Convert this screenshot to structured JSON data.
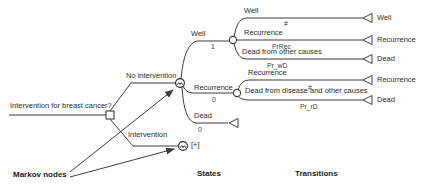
{
  "colors": {
    "line": "#3d3d3d",
    "text": "#2b2b2b",
    "background": "#ffffff"
  },
  "icons": {
    "decision_node": "decision-node-square-icon",
    "markov_node": "markov-node-circle-m-icon",
    "chance_node": "chance-node-circle-icon",
    "terminal_node": "terminal-node-triangle-icon",
    "annotation_arrow": "arrow-icon"
  },
  "tree": {
    "root_question": "Intervention for breast cancer?",
    "decision_branches": [
      {
        "label": "No intervention"
      },
      {
        "label": "Intervention",
        "collapsed_indicator": "[+]"
      }
    ],
    "markov_states": [
      {
        "label": "Well",
        "initial_prob": "1"
      },
      {
        "label": "Recurrence",
        "initial_prob": "0"
      },
      {
        "label": "Dead",
        "initial_prob": "0"
      }
    ],
    "well_transitions": [
      {
        "label": "Well",
        "probability": "#",
        "terminal": "Well"
      },
      {
        "label": "Recurrence",
        "probability": "PrRec",
        "terminal": "Recurrence"
      },
      {
        "label": "Dead from other causes",
        "probability": "Pr_wD",
        "terminal": "Dead"
      }
    ],
    "recurrence_transitions": [
      {
        "label": "Recurrence",
        "probability": "#",
        "terminal": "Recurrence"
      },
      {
        "label": "Dead from disease and other causes",
        "probability": "Pr_rD",
        "terminal": "Dead"
      }
    ],
    "annotations": {
      "markov_nodes_label": "Markov nodes",
      "states_label": "States",
      "transitions_label": "Transitions"
    }
  }
}
